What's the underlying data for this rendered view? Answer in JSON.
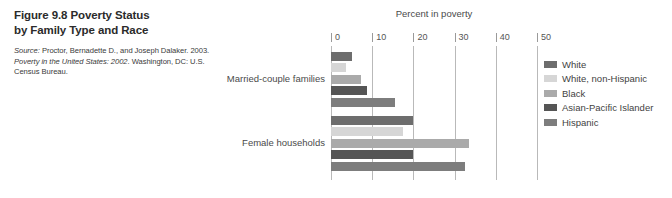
{
  "figure": {
    "number": "Figure 9.8",
    "title": "Poverty Status by Family Type and Race",
    "title_line1": "Figure 9.8  Poverty Status",
    "title_line2": "by Family Type and Race",
    "source_label": "Source:",
    "source_text_1": " Proctor, Bernadette D., and Joseph Dalaker. 2003. ",
    "source_italic": "Poverty in the United States: 2002",
    "source_text_2": ". Washington, DC: U.S. Census Bureau."
  },
  "chart_data": {
    "type": "bar",
    "orientation": "horizontal",
    "title": "",
    "xlabel": "Percent in poverty",
    "ylabel": "",
    "xlim": [
      0,
      50
    ],
    "xticks": [
      0,
      10,
      20,
      30,
      40,
      50
    ],
    "xtick_labels": [
      "0",
      "10",
      "20",
      "30",
      "40",
      "50"
    ],
    "grid": true,
    "grid_axis": "x",
    "legend_position": "right",
    "categories": [
      "Married-couple families",
      "Female households"
    ],
    "series": [
      {
        "name": "White",
        "color": "#6d6d6d",
        "values": [
          5.1,
          20.0
        ]
      },
      {
        "name": "White, non-Hispanic",
        "color": "#d6d6d6",
        "values": [
          3.7,
          17.4
        ]
      },
      {
        "name": "Black",
        "color": "#aaaaaa",
        "values": [
          7.3,
          33.4
        ]
      },
      {
        "name": "Asian-Pacific Islander",
        "color": "#555555",
        "values": [
          8.8,
          20.0
        ]
      },
      {
        "name": "Hispanic",
        "color": "#7d7d7d",
        "values": [
          15.6,
          32.5
        ]
      }
    ]
  },
  "colors": {
    "gridline": "#b9b9b9",
    "text": "#4a4a4a",
    "background": "#ffffff"
  }
}
